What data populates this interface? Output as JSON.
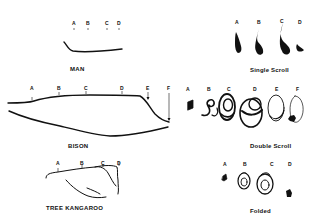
{
  "figure": {
    "panels": [
      {
        "id": "man",
        "title": "MAN",
        "labels": [
          "A",
          "B",
          "C",
          "D"
        ]
      },
      {
        "id": "single-scroll",
        "title": "Single Scroll",
        "labels": [
          "A",
          "B",
          "C",
          "D"
        ]
      },
      {
        "id": "bison",
        "title": "BISON",
        "labels": [
          "A",
          "B",
          "C",
          "D",
          "E",
          "F"
        ]
      },
      {
        "id": "double-scroll",
        "title": "Double Scroll",
        "labels": [
          "A",
          "B",
          "C",
          "D",
          "E",
          "F"
        ]
      },
      {
        "id": "tree-kangaroo",
        "title": "TREE KANGAROO",
        "labels": [
          "A",
          "B",
          "C",
          "D"
        ]
      },
      {
        "id": "folded",
        "title": "Folded",
        "labels": [
          "A",
          "B",
          "C",
          "D"
        ]
      }
    ]
  }
}
